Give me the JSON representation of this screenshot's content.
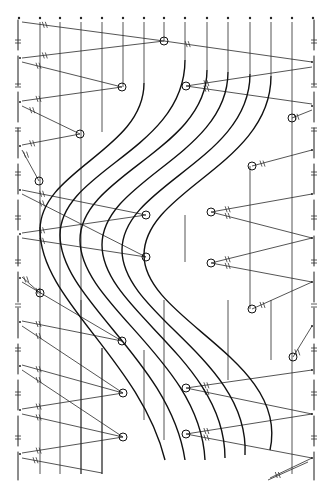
{
  "diagram": {
    "type": "hand-drawn line diagram",
    "width": 327,
    "height": 492,
    "colors": {
      "ink": "#1a1a1a",
      "background": "#ffffff"
    },
    "top_dots_x": [
      19,
      40,
      60,
      81,
      102,
      123,
      144,
      164,
      185,
      207,
      228,
      250,
      271,
      292,
      313
    ],
    "top_dots_y": 18,
    "left_edge_x": 18,
    "right_edge_x": 314,
    "nodes": [
      [
        164,
        41
      ],
      [
        122,
        87
      ],
      [
        186,
        86
      ],
      [
        80,
        134
      ],
      [
        292,
        118
      ],
      [
        39,
        181
      ],
      [
        252,
        166
      ],
      [
        146,
        215
      ],
      [
        211,
        212
      ],
      [
        146,
        257
      ],
      [
        211,
        263
      ],
      [
        40,
        293
      ],
      [
        122,
        341
      ],
      [
        252,
        309
      ],
      [
        293,
        357
      ],
      [
        123,
        393
      ],
      [
        186,
        388
      ],
      [
        123,
        437
      ],
      [
        186,
        434
      ]
    ],
    "zigzag_left": [
      [
        [
          22,
          22
        ],
        [
          164,
          41
        ]
      ],
      [
        [
          22,
          58
        ],
        [
          164,
          41
        ]
      ],
      [
        [
          22,
          62
        ],
        [
          122,
          87
        ]
      ],
      [
        [
          22,
          101
        ],
        [
          122,
          87
        ]
      ],
      [
        [
          22,
          106
        ],
        [
          80,
          134
        ]
      ],
      [
        [
          22,
          145
        ],
        [
          80,
          134
        ]
      ],
      [
        [
          22,
          150
        ],
        [
          39,
          181
        ]
      ],
      [
        [
          22,
          190
        ],
        [
          146,
          215
        ]
      ],
      [
        [
          22,
          194
        ],
        [
          146,
          257
        ]
      ],
      [
        [
          22,
          233
        ],
        [
          146,
          215
        ]
      ],
      [
        [
          22,
          238
        ],
        [
          146,
          257
        ]
      ],
      [
        [
          22,
          277
        ],
        [
          40,
          293
        ]
      ],
      [
        [
          22,
          282
        ],
        [
          122,
          341
        ]
      ],
      [
        [
          22,
          321
        ],
        [
          122,
          341
        ]
      ],
      [
        [
          22,
          326
        ],
        [
          123,
          393
        ]
      ],
      [
        [
          22,
          365
        ],
        [
          123,
          393
        ]
      ],
      [
        [
          22,
          370
        ],
        [
          123,
          437
        ]
      ],
      [
        [
          22,
          409
        ],
        [
          123,
          393
        ]
      ],
      [
        [
          22,
          414
        ],
        [
          123,
          437
        ]
      ],
      [
        [
          22,
          453
        ],
        [
          123,
          437
        ]
      ],
      [
        [
          22,
          458
        ],
        [
          102,
          473
        ]
      ]
    ],
    "zigzag_right": [
      [
        [
          164,
          41
        ],
        [
          312,
          62
        ]
      ],
      [
        [
          186,
          86
        ],
        [
          312,
          67
        ]
      ],
      [
        [
          186,
          86
        ],
        [
          312,
          104
        ]
      ],
      [
        [
          292,
          118
        ],
        [
          312,
          110
        ]
      ],
      [
        [
          252,
          166
        ],
        [
          312,
          150
        ]
      ],
      [
        [
          211,
          212
        ],
        [
          312,
          194
        ]
      ],
      [
        [
          211,
          212
        ],
        [
          312,
          238
        ]
      ],
      [
        [
          211,
          263
        ],
        [
          312,
          238
        ]
      ],
      [
        [
          211,
          263
        ],
        [
          312,
          282
        ]
      ],
      [
        [
          252,
          309
        ],
        [
          312,
          282
        ]
      ],
      [
        [
          293,
          357
        ],
        [
          312,
          326
        ]
      ],
      [
        [
          186,
          388
        ],
        [
          312,
          370
        ]
      ],
      [
        [
          186,
          388
        ],
        [
          312,
          414
        ]
      ],
      [
        [
          186,
          434
        ],
        [
          312,
          414
        ]
      ],
      [
        [
          186,
          434
        ],
        [
          312,
          458
        ]
      ],
      [
        [
          270,
          478
        ],
        [
          312,
          458
        ]
      ]
    ],
    "verticals": [
      [
        40,
        22,
        474
      ],
      [
        60,
        22,
        474
      ],
      [
        81,
        22,
        474
      ],
      [
        102,
        22,
        132
      ],
      [
        102,
        348,
        474
      ],
      [
        123,
        22,
        87
      ],
      [
        144,
        22,
        83
      ],
      [
        164,
        22,
        41
      ],
      [
        185,
        22,
        60
      ],
      [
        207,
        22,
        70
      ],
      [
        228,
        22,
        72
      ],
      [
        250,
        22,
        74
      ],
      [
        271,
        22,
        76
      ],
      [
        292,
        22,
        80
      ]
    ],
    "curves": [
      "M 144 83 C 144 150, 40 170, 40 230 C 40 300, 140 360, 165 460",
      "M 185 60 C 185 150, 60 170, 60 235 C 60 300, 170 360, 185 460",
      "M 207 70 C 207 150, 80 175, 80 240 C 80 305, 200 360, 205 460",
      "M 228 72 C 228 155, 102 180, 102 245 C 102 310, 225 360, 225 458",
      "M 250 74 C 250 160, 122 185, 122 250 C 122 315, 250 360, 245 455",
      "M 271 76 C 271 165, 144 190, 144 255 C 144 320, 290 360, 270 450"
    ]
  }
}
